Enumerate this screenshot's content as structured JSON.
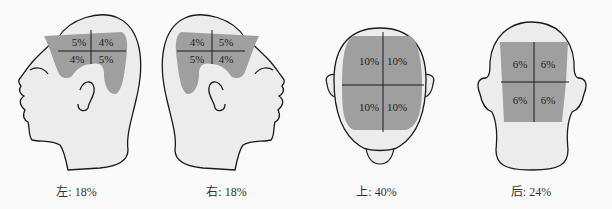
{
  "colors": {
    "background": "#fafafa",
    "head_fill": "#ececec",
    "region_fill": "#9f9f9f",
    "outline": "#1a1a1a"
  },
  "panels": [
    {
      "view": "left",
      "caption": "左: 18%",
      "cells": [
        "5%",
        "4%",
        "4%",
        "5%"
      ]
    },
    {
      "view": "right",
      "caption": "右: 18%",
      "cells": [
        "4%",
        "5%",
        "5%",
        "4%"
      ]
    },
    {
      "view": "top",
      "caption": "上: 40%",
      "cells": [
        "10%",
        "10%",
        "10%",
        "10%"
      ]
    },
    {
      "view": "back",
      "caption": "后: 24%",
      "cells": [
        "6%",
        "6%",
        "6%",
        "6%"
      ]
    }
  ]
}
